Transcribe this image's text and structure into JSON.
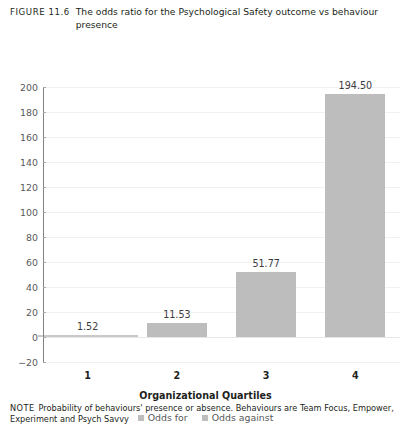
{
  "caption": {
    "label": "FIGURE 11.6",
    "text": "The odds ratio for the Psychological Safety outcome vs behaviour presence"
  },
  "note": {
    "label": "NOTE",
    "text": "Probability of behaviours' presence or absence. Behaviours are Team Focus, Empower,",
    "text_line2": "Experiment and Psych Savvy"
  },
  "colors": {
    "bar": "#bdbdbd",
    "axis": "#808285",
    "grid": "#f1f1f2",
    "text": "#231f20"
  },
  "chart_data": {
    "type": "bar",
    "title": "The odds ratio for the Psychological Safety outcome vs behaviour presence",
    "xlabel": "Organizational Quartiles",
    "ylabel": "",
    "categories": [
      "1",
      "2",
      "3",
      "4"
    ],
    "values": [
      1.52,
      11.53,
      51.77,
      194.5
    ],
    "data_labels": [
      "1.52",
      "11.53",
      "51.77",
      "194.50"
    ],
    "ylim": [
      -20,
      200
    ],
    "yticks": [
      200,
      180,
      160,
      140,
      120,
      100,
      80,
      60,
      40,
      20,
      0,
      -20
    ],
    "ytick_labels": [
      "200",
      "180",
      "160",
      "140",
      "120",
      "100",
      "80",
      "60",
      "40",
      "20",
      "0",
      "−20"
    ],
    "grid": true,
    "legend_position": "bottom",
    "legend": [
      "Odds for",
      "Odds against"
    ],
    "series": [
      {
        "name": "Odds against",
        "values": [
          1.52,
          11.53,
          51.77,
          194.5
        ]
      }
    ]
  }
}
